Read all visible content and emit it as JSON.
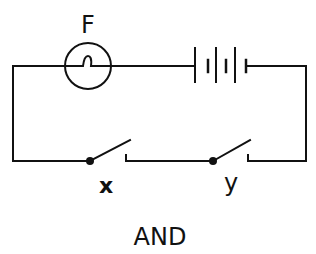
{
  "diagram": {
    "type": "circuit",
    "lamp_label": "F",
    "switch_labels": [
      "x",
      "y"
    ],
    "caption": "AND",
    "components": [
      {
        "type": "lamp",
        "label": "F"
      },
      {
        "type": "battery",
        "cells": 2
      },
      {
        "type": "switch",
        "label": "x",
        "state": "open"
      },
      {
        "type": "switch",
        "label": "y",
        "state": "open"
      }
    ],
    "colors": {
      "line": "#111111",
      "background": "#ffffff"
    }
  }
}
